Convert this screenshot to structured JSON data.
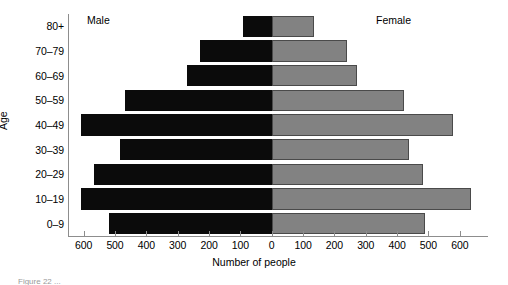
{
  "chart_data": {
    "type": "bar",
    "subtype": "population-pyramid",
    "title": "",
    "xlabel": "Number of people",
    "ylabel": "Age",
    "categories": [
      "0–9",
      "10–19",
      "20–29",
      "30–39",
      "40–49",
      "50–59",
      "60–69",
      "70–79",
      "80+"
    ],
    "series": [
      {
        "name": "Male",
        "side": "left",
        "color": "#0b0b0b",
        "values": [
          518,
          607,
          568,
          485,
          610,
          469,
          271,
          228,
          92
        ]
      },
      {
        "name": "Female",
        "side": "right",
        "color": "#828282",
        "values": [
          490,
          635,
          484,
          439,
          577,
          423,
          271,
          239,
          135
        ]
      }
    ],
    "xlim": [
      -650,
      690
    ],
    "x_tick_values": [
      -600,
      -500,
      -400,
      -300,
      -200,
      -100,
      0,
      100,
      200,
      300,
      400,
      500,
      600
    ],
    "x_tick_labels": [
      "600",
      "500",
      "400",
      "300",
      "200",
      "100",
      "0",
      "100",
      "200",
      "300",
      "400",
      "500",
      "600"
    ],
    "grid": false,
    "legend_position": "inside-top"
  },
  "labels": {
    "male": "Male",
    "female": "Female",
    "axis_x": "Number of people",
    "axis_y": "Age"
  },
  "caption": {
    "text": "Figure 22    ..."
  }
}
